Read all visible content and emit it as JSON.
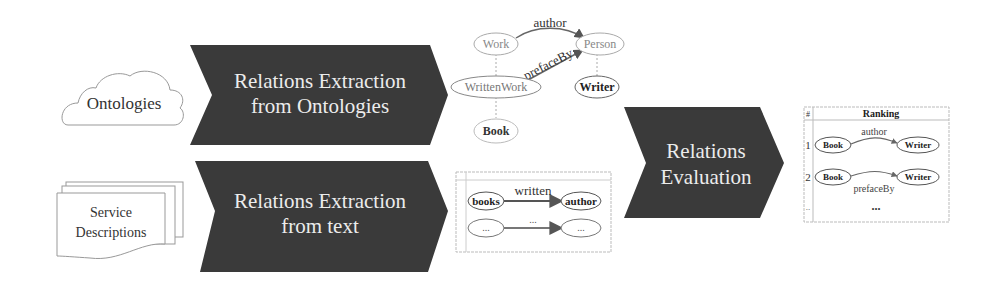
{
  "inputs": {
    "ontologies": {
      "label": "Ontologies",
      "icon": "cloud-icon"
    },
    "service_descriptions": {
      "line1": "Service",
      "line2": "Descriptions",
      "icon": "document-stack-icon"
    }
  },
  "steps": {
    "extract_ontologies": {
      "line1": "Relations Extraction",
      "line2": "from Ontologies"
    },
    "extract_text": {
      "line1": "Relations Extraction",
      "line2": "from text"
    },
    "evaluation": {
      "line1": "Relations",
      "line2": "Evaluation"
    }
  },
  "ontology_graph": {
    "nodes": {
      "work": "Work",
      "person": "Person",
      "written_work": "WrittenWork",
      "writer": "Writer",
      "book": "Book"
    },
    "edges": {
      "author": "author",
      "preface_by": "prefaceBy"
    }
  },
  "text_graph": {
    "row1": {
      "from": "books",
      "edge": "written",
      "to": "author"
    },
    "row2": {
      "from": "...",
      "edge": "...",
      "to": "..."
    }
  },
  "ranking": {
    "col_index": "#",
    "col_title": "Ranking",
    "rows": [
      {
        "index": "1",
        "from": "Book",
        "edge": "author",
        "to": "Writer"
      },
      {
        "index": "2",
        "from": "Book",
        "edge": "prefaceBy",
        "to": "Writer"
      },
      {
        "index": "..",
        "ellipsis": "..."
      }
    ]
  },
  "colors": {
    "arrow_fill": "#3a3a3a",
    "arrow_text": "#ececec",
    "line": "#888888",
    "text": "#333333"
  }
}
